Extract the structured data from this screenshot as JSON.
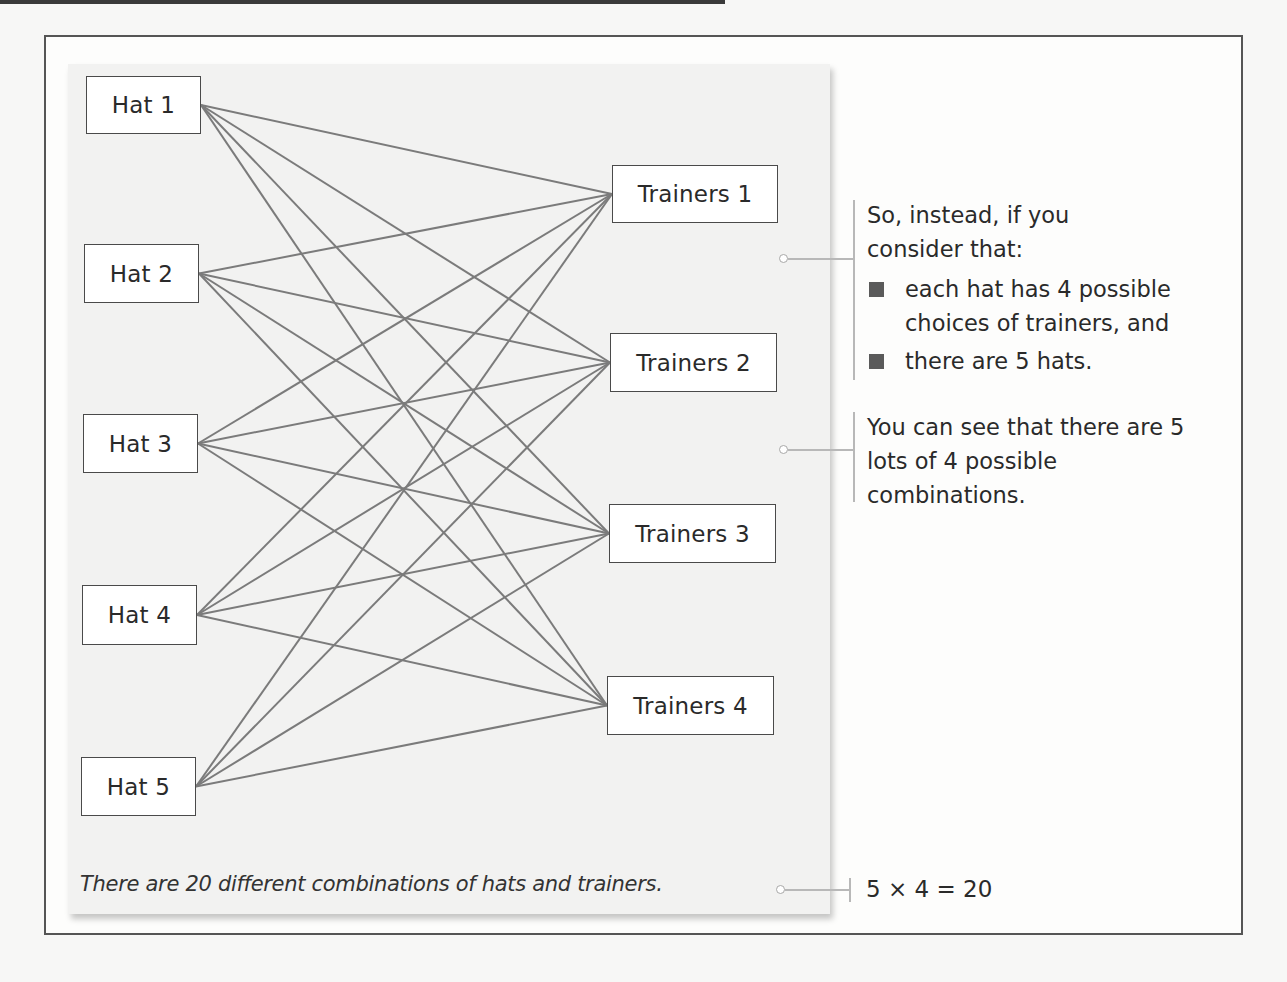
{
  "diagram": {
    "hats": [
      {
        "label": "Hat 1",
        "box": {
          "x": 86,
          "y": 76,
          "w": 115,
          "h": 58
        }
      },
      {
        "label": "Hat 2",
        "box": {
          "x": 84,
          "y": 244,
          "w": 115,
          "h": 59
        }
      },
      {
        "label": "Hat 3",
        "box": {
          "x": 83,
          "y": 414,
          "w": 115,
          "h": 59
        }
      },
      {
        "label": "Hat 4",
        "box": {
          "x": 82,
          "y": 585,
          "w": 115,
          "h": 60
        }
      },
      {
        "label": "Hat 5",
        "box": {
          "x": 81,
          "y": 757,
          "w": 115,
          "h": 59
        }
      }
    ],
    "trainers": [
      {
        "label": "Trainers 1",
        "box": {
          "x": 612,
          "y": 165,
          "w": 166,
          "h": 58
        }
      },
      {
        "label": "Trainers 2",
        "box": {
          "x": 610,
          "y": 333,
          "w": 167,
          "h": 59
        }
      },
      {
        "label": "Trainers 3",
        "box": {
          "x": 609,
          "y": 504,
          "w": 167,
          "h": 59
        }
      },
      {
        "label": "Trainers 4",
        "box": {
          "x": 607,
          "y": 676,
          "w": 167,
          "h": 59
        }
      }
    ],
    "edges_note": "every hat is connected to every trainer (5 x 4 = 20 lines)",
    "line_color": "#7b7b7b",
    "caption": "There are 20 different combinations of hats and trainers."
  },
  "notes": {
    "first": {
      "intro": "So, instead, if you consider that:",
      "bullets": [
        "each hat has 4 possible choices of trainers, and",
        "there are 5 hats."
      ]
    },
    "second": "You can see that there are 5 lots of 4 possible combinations.",
    "equation": "5 × 4 = 20"
  },
  "colors": {
    "frame": "#555555",
    "panel": "#f2f2f1",
    "box_border": "#4a4a4a",
    "bullet": "#5a5a5a",
    "connector": "#b8b8b8"
  }
}
